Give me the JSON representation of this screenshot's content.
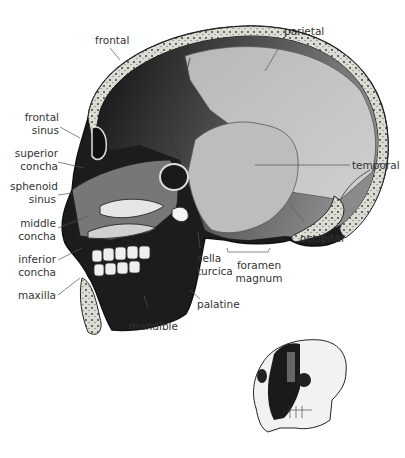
{
  "diagram": {
    "labels": {
      "frontal": "frontal",
      "parietal": "parietal",
      "frontal_sinus_1": "frontal",
      "frontal_sinus_2": "sinus",
      "superior_concha_1": "superior",
      "superior_concha_2": "concha",
      "sphenoid_sinus_1": "sphenoid",
      "sphenoid_sinus_2": "sinus",
      "middle_concha_1": "middle",
      "middle_concha_2": "concha",
      "inferior_concha_1": "inferior",
      "inferior_concha_2": "concha",
      "maxilla": "maxilla",
      "mandible": "mandible",
      "palatine": "palatine",
      "sella_turcica_1": "sella",
      "sella_turcica_2": "turcica",
      "foramen_magnum_1": "foramen",
      "foramen_magnum_2": "magnum",
      "temporal": "temporal",
      "occipital": "occipital"
    },
    "inset": "orientation-skull-cutaway",
    "colors": {
      "bone_edge": "#d8d8d0",
      "dark": "#1a1a1a",
      "mid": "#6e6e6e",
      "light": "#c8c8c8",
      "label": "#333333"
    }
  }
}
